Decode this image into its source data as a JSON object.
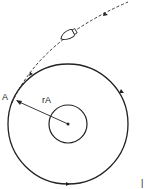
{
  "diagram": {
    "labels": {
      "point_a": "A",
      "radius": "rA",
      "margin_mark": "|"
    },
    "elements": {
      "outer_orbit": "circular orbit",
      "planet": "central body",
      "trajectory": "dashed approach trajectory",
      "spacecraft": "spacecraft-icon"
    },
    "colors": {
      "stroke": "#222222",
      "background": "#ffffff"
    }
  }
}
